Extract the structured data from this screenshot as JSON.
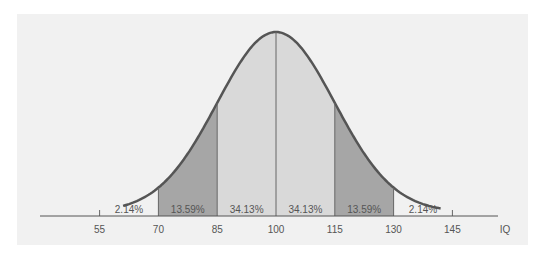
{
  "chart_data": {
    "type": "area",
    "title": "",
    "xlabel": "IQ",
    "ylabel": "",
    "mean": 100,
    "sd": 15,
    "x_ticks": [
      55,
      70,
      85,
      100,
      115,
      130,
      145
    ],
    "regions": [
      {
        "from": 55,
        "to": 70,
        "percent": "2.14%",
        "shade": "none"
      },
      {
        "from": 70,
        "to": 85,
        "percent": "13.59%",
        "shade": "dark"
      },
      {
        "from": 85,
        "to": 100,
        "percent": "34.13%",
        "shade": "light"
      },
      {
        "from": 100,
        "to": 115,
        "percent": "34.13%",
        "shade": "light"
      },
      {
        "from": 115,
        "to": 130,
        "percent": "13.59%",
        "shade": "dark"
      },
      {
        "from": 130,
        "to": 145,
        "percent": "2.14%",
        "shade": "none"
      }
    ],
    "grid": false,
    "legend": null
  },
  "labels": {
    "axis_label": "IQ",
    "ticks": [
      "55",
      "70",
      "85",
      "100",
      "115",
      "130",
      "145"
    ],
    "percents": [
      "2.14%",
      "13.59%",
      "34.13%",
      "34.13%",
      "13.59%",
      "2.14%"
    ]
  },
  "colors": {
    "panel": "#f1f1f1",
    "light_band": "#d9d9d9",
    "dark_band": "#a6a6a6",
    "curve": "#555555",
    "axis": "#555555"
  }
}
